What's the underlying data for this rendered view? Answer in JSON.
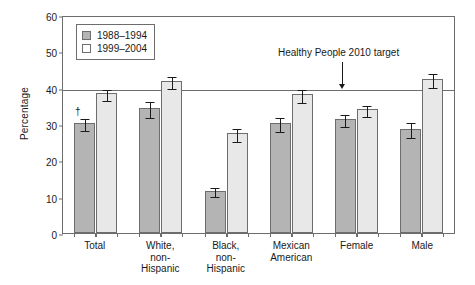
{
  "chart_data": {
    "type": "bar",
    "title": "",
    "xlabel": "",
    "ylabel": "Percentage",
    "ylim": [
      0,
      60
    ],
    "yticks": [
      0,
      10,
      20,
      30,
      40,
      50,
      60
    ],
    "grid": false,
    "legend_position": "top-left",
    "categories": [
      "Total",
      "White,\nnon-\nHispanic",
      "Black,\nnon-\nHispanic",
      "Mexican\nAmerican",
      "Female",
      "Male"
    ],
    "series": [
      {
        "name": "1988–1994",
        "color": "#b4b4b4",
        "values": [
          30.3,
          34.5,
          11.7,
          30.3,
          31.4,
          28.7
        ],
        "errors": [
          1.6,
          2.2,
          1.3,
          1.9,
          1.6,
          2.0
        ],
        "markers": [
          "†",
          "",
          "",
          "",
          "",
          ""
        ]
      },
      {
        "name": "1999–2004",
        "color": "#e8e8e8",
        "values": [
          38.4,
          41.9,
          27.4,
          38.2,
          34.0,
          42.4
        ],
        "errors": [
          1.4,
          1.7,
          1.9,
          1.8,
          1.6,
          1.9
        ],
        "markers": [
          "",
          "",
          "",
          "",
          "",
          ""
        ]
      }
    ],
    "annotations": [
      {
        "text": "Healthy People 2010 target",
        "value": 40,
        "type": "reference-line-with-arrow"
      }
    ]
  }
}
